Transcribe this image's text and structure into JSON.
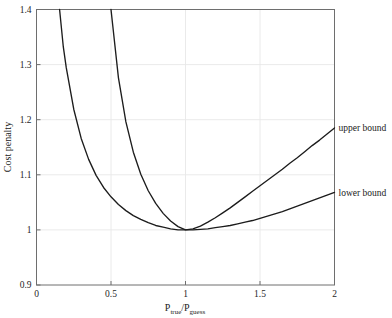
{
  "chart_data": {
    "type": "line",
    "title": "",
    "subtitle": "",
    "xlabel": "Ptrue/Pguess",
    "xlabel_parts": {
      "p1": "P",
      "sub1": "true",
      "slash": "/",
      "p2": "P",
      "sub2": "guess"
    },
    "ylabel": "Cost penalty",
    "xlim": [
      0,
      2
    ],
    "ylim": [
      0.9,
      1.4
    ],
    "xticks": [
      0,
      0.5,
      1,
      1.5,
      2
    ],
    "xticklabels": [
      "0",
      "0.5",
      "1",
      "1.5",
      "2"
    ],
    "yticks": [
      0.9,
      1.0,
      1.1,
      1.2,
      1.3,
      1.4
    ],
    "yticklabels": [
      "0.9",
      "1",
      "1.1",
      "1.2",
      "1.3",
      "1.4"
    ],
    "grid": "horizontal-and-vertical-light",
    "legend_position": "right-of-axes-inline-labels",
    "line_color": "#1c1c1c",
    "frame_color": "#6e6e6e",
    "grid_color": "#e8e8e8",
    "series": [
      {
        "name": "upper bound",
        "label": "upper bound",
        "label_x": 2.0,
        "label_y": 1.185,
        "minimum": {
          "x": 1.0,
          "y": 1.0
        },
        "crosses_top_at_x": 0.5,
        "value_at_xmax": 1.185,
        "x": [
          0.5,
          0.55,
          0.6,
          0.65,
          0.7,
          0.75,
          0.8,
          0.85,
          0.9,
          0.95,
          1.0,
          1.05,
          1.1,
          1.15,
          1.2,
          1.25,
          1.3,
          1.35,
          1.4,
          1.45,
          1.5,
          1.55,
          1.6,
          1.65,
          1.7,
          1.75,
          1.8,
          1.85,
          1.9,
          1.95,
          2.0
        ],
        "y": [
          1.4,
          1.276,
          1.196,
          1.141,
          1.101,
          1.071,
          1.048,
          1.03,
          1.016,
          1.006,
          1.0,
          1.002,
          1.007,
          1.014,
          1.022,
          1.031,
          1.04,
          1.05,
          1.06,
          1.07,
          1.08,
          1.09,
          1.1,
          1.11,
          1.121,
          1.131,
          1.142,
          1.153,
          1.163,
          1.174,
          1.185
        ]
      },
      {
        "name": "lower bound",
        "label": "lower bound",
        "label_x": 2.0,
        "label_y": 1.068,
        "minimum": {
          "x": 1.0,
          "y": 1.0
        },
        "crosses_top_at_x": 0.155,
        "value_at_xmax": 1.068,
        "x": [
          0.155,
          0.18,
          0.2,
          0.25,
          0.3,
          0.35,
          0.4,
          0.45,
          0.5,
          0.55,
          0.6,
          0.65,
          0.7,
          0.75,
          0.8,
          0.85,
          0.9,
          0.95,
          1.0,
          1.05,
          1.1,
          1.15,
          1.2,
          1.25,
          1.3,
          1.35,
          1.4,
          1.45,
          1.5,
          1.55,
          1.6,
          1.65,
          1.7,
          1.75,
          1.8,
          1.85,
          1.9,
          1.95,
          2.0
        ],
        "y": [
          1.4,
          1.332,
          1.294,
          1.219,
          1.166,
          1.128,
          1.099,
          1.077,
          1.06,
          1.046,
          1.035,
          1.026,
          1.019,
          1.013,
          1.008,
          1.005,
          1.002,
          1.0,
          1.0,
          1.0,
          1.001,
          1.002,
          1.004,
          1.006,
          1.008,
          1.011,
          1.014,
          1.017,
          1.021,
          1.025,
          1.029,
          1.033,
          1.038,
          1.043,
          1.048,
          1.053,
          1.058,
          1.063,
          1.068
        ]
      }
    ]
  },
  "axes": {
    "x_label_text": "Ptrue/Pguess",
    "y_label_text": "Cost penalty"
  }
}
